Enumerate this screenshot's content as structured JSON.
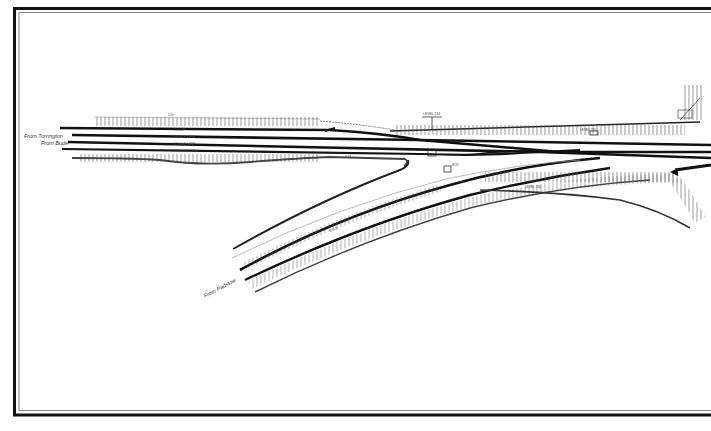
{
  "drawing": {
    "type": "railway track plan",
    "ink_color": "#111111",
    "paper_color": "#ffffff"
  },
  "origins": {
    "from_torrington": "From Torrington",
    "from_bude": "From Bude",
    "from_padstow": "From Padstow"
  },
  "track_labels": {
    "loop": "LOOP",
    "single_line_1": "SINGLE LINE",
    "single_line_2": "SINGLE LINE",
    "middle_siding": "MIDDLE SIDING"
  },
  "annotations": {
    "mile_top_left": "214",
    "signal_top": "LEVEL 234",
    "mile_mid": "1 16",
    "box_label": "BOX",
    "note_right": "LEVEL 226",
    "lower_note": "LEVEL 236",
    "branch_note": "BUDE"
  }
}
